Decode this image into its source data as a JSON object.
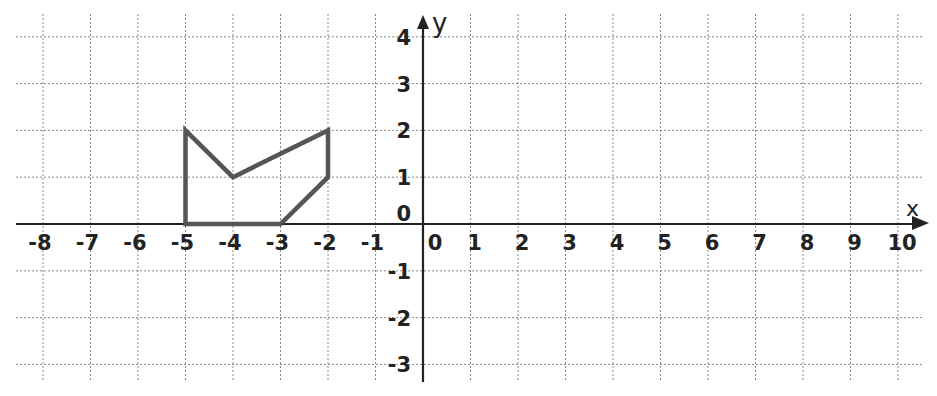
{
  "chart_data": {
    "type": "scatter",
    "title": "",
    "xlabel": "x",
    "ylabel": "y",
    "xlim": [
      -8,
      10
    ],
    "ylim": [
      -3,
      4
    ],
    "grid": true,
    "grid_style": "dotted",
    "x_ticks": [
      -8,
      -7,
      -6,
      -5,
      -4,
      -3,
      -2,
      -1,
      0,
      1,
      2,
      3,
      4,
      5,
      6,
      7,
      8,
      9,
      10
    ],
    "y_ticks": [
      4,
      3,
      2,
      1,
      0,
      -1,
      -2,
      -3
    ],
    "x_tick_labels": [
      "-8",
      "-7",
      "-6",
      "-5",
      "-4",
      "-3",
      "-2",
      "-1",
      "0",
      "1",
      "2",
      "3",
      "4",
      "5",
      "6",
      "7",
      "8",
      "9",
      "10"
    ],
    "y_tick_labels": [
      "4",
      "3",
      "2",
      "1",
      "0",
      "-1",
      "-2",
      "-3"
    ],
    "series": [
      {
        "name": "polygon",
        "kind": "closed-polygon",
        "color": "#555555",
        "points": [
          [
            -5,
            0
          ],
          [
            -5,
            2
          ],
          [
            -4,
            1
          ],
          [
            -2,
            2
          ],
          [
            -2,
            1
          ],
          [
            -3,
            0
          ]
        ]
      }
    ]
  },
  "colors": {
    "axis": "#222222",
    "grid": "#888888",
    "shape": "#555555"
  },
  "labels": {
    "x_axis": "x",
    "y_axis": "y"
  }
}
